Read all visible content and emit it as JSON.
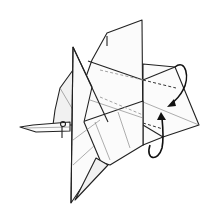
{
  "diagram": {
    "colors": {
      "line": "#222222",
      "paper": "#fbfbfb",
      "background": "#ffffff"
    },
    "symbols": [
      {
        "type": "valley-fold-line",
        "count": 4
      },
      {
        "type": "fold-over-arrow",
        "count": 2,
        "direction": "toward center crease"
      }
    ]
  }
}
